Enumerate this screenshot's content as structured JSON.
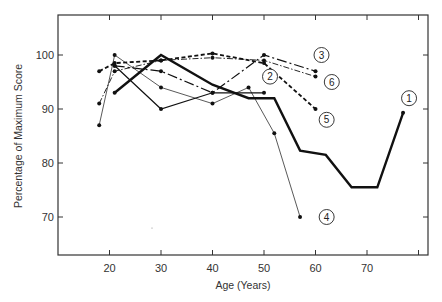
{
  "chart_data": {
    "type": "line",
    "title": "",
    "xlabel": "Age (Years)",
    "ylabel": "Percentage of Maximum Score",
    "xlim": [
      10,
      82
    ],
    "ylim": [
      63,
      107
    ],
    "x_ticks": [
      20,
      30,
      40,
      50,
      60,
      70,
      80
    ],
    "x_tick_labels": [
      "20",
      "30",
      "40",
      "50",
      "60",
      "70",
      ""
    ],
    "y_ticks": [
      70,
      80,
      90,
      100
    ],
    "y_tick_labels": [
      "70",
      "80",
      "90",
      "100"
    ],
    "grid": false,
    "legend": "inline numbered circles",
    "series": [
      {
        "name": "1",
        "style": "thick-solid",
        "x": [
          21,
          30,
          40,
          47,
          52,
          57,
          62,
          67,
          72,
          77
        ],
        "y": [
          93,
          100,
          94.5,
          92,
          92,
          82.3,
          81.5,
          75.5,
          75.5,
          89.3
        ],
        "label_pos": [
          77,
          92
        ]
      },
      {
        "name": "2",
        "style": "solid",
        "x": [
          21,
          30,
          40,
          50
        ],
        "y": [
          98,
          90,
          93,
          93
        ],
        "label_pos": [
          50,
          96
        ]
      },
      {
        "name": "3",
        "style": "long-dash-dot",
        "x": [
          21,
          30,
          40,
          50,
          60
        ],
        "y": [
          98,
          97,
          93,
          100,
          97
        ],
        "label_pos": [
          60,
          100
        ]
      },
      {
        "name": "4",
        "style": "thin-solid",
        "x": [
          18,
          21,
          30,
          40,
          47,
          52,
          57
        ],
        "y": [
          87,
          100,
          94,
          91,
          94,
          85.5,
          70
        ],
        "label_pos": [
          61,
          70
        ]
      },
      {
        "name": "5",
        "style": "dashed-bold",
        "x": [
          18,
          21,
          30,
          40,
          50,
          60
        ],
        "y": [
          97,
          98.5,
          99,
          100.3,
          98.5,
          90
        ],
        "label_pos": [
          61,
          88
        ]
      },
      {
        "name": "6",
        "style": "dash-dot-thin",
        "x": [
          18,
          21,
          30,
          40,
          50,
          60
        ],
        "y": [
          91,
          97,
          99,
          99.5,
          99,
          96
        ],
        "label_pos": [
          62,
          95
        ]
      }
    ]
  },
  "axes": {
    "xlabel": "Age (Years)",
    "ylabel": "Percentage of Maximum Score"
  }
}
